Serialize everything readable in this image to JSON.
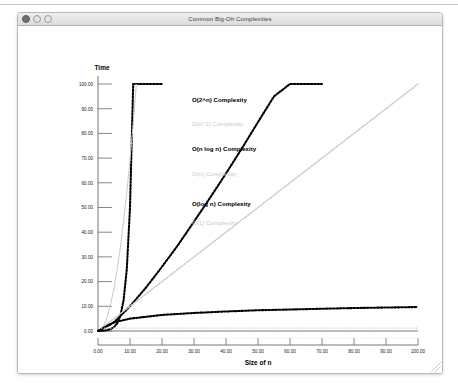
{
  "window": {
    "title": "Common Big-Oh Complexities",
    "controls": [
      {
        "name": "close",
        "label": "Close"
      },
      {
        "name": "minimize",
        "label": "Minimize"
      },
      {
        "name": "zoom",
        "label": "Zoom"
      }
    ]
  },
  "chart_data": {
    "type": "line",
    "title": "Common Big-Oh Complexities",
    "xlabel": "Size of n",
    "ylabel": "Time",
    "xlim": [
      0,
      100
    ],
    "ylim": [
      0,
      100
    ],
    "xticks": [
      "0.00",
      "10.00",
      "20.00",
      "30.00",
      "40.00",
      "50.00",
      "60.00",
      "70.00",
      "80.00",
      "90.00",
      "100.00"
    ],
    "yticks": [
      "0.00",
      "10.00",
      "20.00",
      "30.00",
      "40.00",
      "50.00",
      "60.00",
      "70.00",
      "80.00",
      "90.00",
      "100.00"
    ],
    "xtick_values": [
      0,
      10,
      20,
      30,
      40,
      50,
      60,
      70,
      80,
      90,
      100
    ],
    "ytick_values": [
      0,
      10,
      20,
      30,
      40,
      50,
      60,
      70,
      80,
      90,
      100
    ],
    "grid": true,
    "legend_position": "inline-annotations",
    "series": [
      {
        "name": "O(2^n) Complexity",
        "label": "O(2^n) Complexity",
        "style": "bold-dotted",
        "color": "#000000",
        "x": [
          0,
          1,
          2,
          3,
          4,
          5,
          6,
          7,
          8,
          9,
          10,
          11,
          12,
          13,
          14,
          15,
          16,
          17,
          18,
          19,
          20
        ],
        "y": [
          0,
          0.1,
          0.2,
          0.4,
          0.8,
          1.6,
          3.1,
          6.2,
          12.5,
          25,
          50,
          100,
          100,
          100,
          100,
          100,
          100,
          100,
          100,
          100,
          100
        ]
      },
      {
        "name": "O(n^2) Complexity",
        "label": "O(n^2) Complexity",
        "style": "faint-line",
        "color": "#cbcbcb",
        "x": [
          0,
          1,
          2,
          3,
          4,
          5,
          6,
          7,
          8,
          9,
          10,
          11,
          12
        ],
        "y": [
          0,
          0.69,
          2.78,
          6.25,
          11.1,
          17.4,
          25,
          34,
          44.4,
          56.3,
          69.4,
          84,
          100
        ]
      },
      {
        "name": "O(n log n) Complexity",
        "label": "O(n log n) Complexity",
        "style": "bold-dotted",
        "color": "#000000",
        "x": [
          0,
          5,
          10,
          15,
          20,
          25,
          30,
          35,
          40,
          45,
          50,
          55,
          60,
          65,
          70
        ],
        "y": [
          0,
          3.5,
          10,
          17.6,
          26,
          34.8,
          44.3,
          53.9,
          63.8,
          74,
          84.6,
          95,
          100,
          100,
          100
        ]
      },
      {
        "name": "O(n) Complexity",
        "label": "O(n) Complexity",
        "style": "faint-dotted",
        "color": "#cbcbcb",
        "x": [
          0,
          10,
          20,
          30,
          40,
          50,
          60,
          70,
          80,
          90,
          100
        ],
        "y": [
          0,
          10,
          20,
          30,
          40,
          50,
          60,
          70,
          80,
          90,
          100
        ]
      },
      {
        "name": "O(log n) Complexity",
        "label": "O(log n) Complexity",
        "style": "bold-dotted",
        "color": "#000000",
        "x": [
          0,
          2,
          5,
          10,
          20,
          30,
          40,
          50,
          60,
          70,
          80,
          90,
          100
        ],
        "y": [
          0,
          1.5,
          3.5,
          5.0,
          6.5,
          7.3,
          7.9,
          8.4,
          8.7,
          9.0,
          9.3,
          9.5,
          9.7
        ]
      },
      {
        "name": "O(1) Complexity",
        "label": "O(1) Complexity",
        "style": "faint-dotted-flat",
        "color": "#cbcbcb",
        "x": [
          0,
          100
        ],
        "y": [
          1.2,
          1.2
        ]
      }
    ],
    "annotations": [
      {
        "text": "O(2^n) Complexity",
        "emphasis": "bold",
        "x_px": 191,
        "y_px": 100
      },
      {
        "text": "O(n^2) Complexity",
        "emphasis": "faint",
        "x_px": 191,
        "y_px": 124
      },
      {
        "text": "O(n log n) Complexity",
        "emphasis": "bold",
        "x_px": 191,
        "y_px": 149
      },
      {
        "text": "O(n) Complexity",
        "emphasis": "faint",
        "x_px": 191,
        "y_px": 174
      },
      {
        "text": "O(log n) Complexity",
        "emphasis": "bold",
        "x_px": 191,
        "y_px": 204
      },
      {
        "text": "O(1) Complexity",
        "emphasis": "faint",
        "x_px": 191,
        "y_px": 223
      }
    ]
  },
  "colors": {
    "bold_series": "#000000",
    "faint_series": "#cbcbcb",
    "axis": "#555555",
    "grid": "#d8d8d8",
    "titlebar": "#e4e4e4"
  }
}
